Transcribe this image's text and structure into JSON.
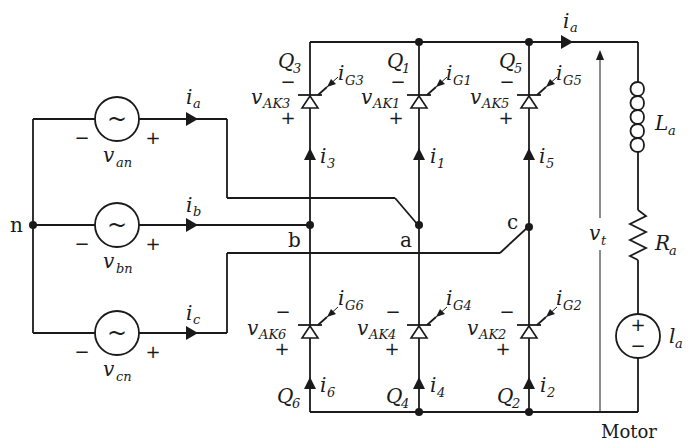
{
  "diagram": {
    "neutral_node": "n",
    "nodes": [
      "a",
      "b",
      "c"
    ],
    "sources": [
      {
        "id": "van",
        "var": "v",
        "sub": "an",
        "current": "i",
        "current_sub": "a",
        "minus": "−",
        "plus": "+"
      },
      {
        "id": "vbn",
        "var": "v",
        "sub": "bn",
        "current": "i",
        "current_sub": "b",
        "minus": "−",
        "plus": "+"
      },
      {
        "id": "vcn",
        "var": "v",
        "sub": "cn",
        "current": "i",
        "current_sub": "c",
        "minus": "−",
        "plus": "+"
      }
    ],
    "thyristors_top": [
      {
        "name": "Q",
        "name_sub": "3",
        "vak": "v",
        "vak_sub": "AK3",
        "gate": "i",
        "gate_sub": "G3",
        "cur": "i",
        "cur_sub": "3"
      },
      {
        "name": "Q",
        "name_sub": "1",
        "vak": "v",
        "vak_sub": "AK1",
        "gate": "i",
        "gate_sub": "G1",
        "cur": "i",
        "cur_sub": "1"
      },
      {
        "name": "Q",
        "name_sub": "5",
        "vak": "v",
        "vak_sub": "AK5",
        "gate": "i",
        "gate_sub": "G5",
        "cur": "i",
        "cur_sub": "5"
      }
    ],
    "thyristors_bottom": [
      {
        "name": "Q",
        "name_sub": "6",
        "vak": "v",
        "vak_sub": "AK6",
        "gate": "i",
        "gate_sub": "G6",
        "cur": "i",
        "cur_sub": "6"
      },
      {
        "name": "Q",
        "name_sub": "4",
        "vak": "v",
        "vak_sub": "AK4",
        "gate": "i",
        "gate_sub": "G4",
        "cur": "i",
        "cur_sub": "4"
      },
      {
        "name": "Q",
        "name_sub": "2",
        "vak": "v",
        "vak_sub": "AK2",
        "gate": "i",
        "gate_sub": "G2",
        "cur": "i",
        "cur_sub": "2"
      }
    ],
    "motor": {
      "label": "Motor",
      "armature_current": "i",
      "armature_current_sub": "a",
      "terminal_voltage": "v",
      "terminal_voltage_sub": "t",
      "inductor": "L",
      "inductor_sub": "a",
      "resistor": "R",
      "resistor_sub": "a",
      "emf": "l",
      "emf_sub": "a",
      "emf_plus": "+",
      "emf_minus": "−"
    },
    "sign_minus": "−",
    "sign_plus": "+",
    "sine_glyph": "~"
  }
}
